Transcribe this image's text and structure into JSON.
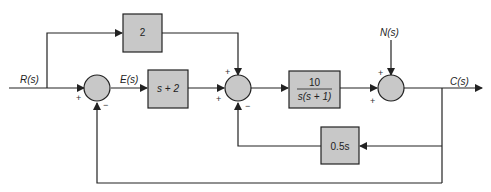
{
  "diagram": {
    "title": "",
    "colors": {
      "background": "#ffffff",
      "block_fill": "#c8c8c8",
      "stroke": "#222222"
    },
    "signals": {
      "input": "R(s)",
      "error": "E(s)",
      "disturbance": "N(s)",
      "output": "C(s)"
    },
    "blocks": {
      "feedforward": "2",
      "controller": "s + 2",
      "plant_num": "10",
      "plant_den": "s(s + 1)",
      "rate_feedback": "0.5s"
    },
    "signs": {
      "sum1_input": "+",
      "sum1_feedback": "−",
      "sum2_top": "+",
      "sum2_left": "+",
      "sum2_bottom": "−",
      "sum3_top": "+",
      "sum3_left": "+"
    }
  }
}
